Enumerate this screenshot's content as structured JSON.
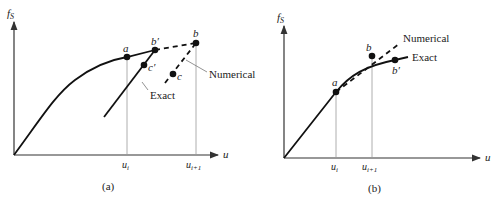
{
  "panel_a": {
    "caption": "(a)",
    "y_axis_label": "f",
    "y_axis_sub": "S",
    "x_axis_label": "u",
    "tick_ui": "u",
    "tick_ui_sub": "i",
    "tick_ui1": "u",
    "tick_ui1_sub": "i+1",
    "point_a": "a",
    "point_b": "b",
    "point_bprime": "b′",
    "point_c": "c",
    "point_cprime": "c′",
    "label_exact": "Exact",
    "label_numerical": "Numerical"
  },
  "panel_b": {
    "caption": "(b)",
    "y_axis_label": "f",
    "y_axis_sub": "S",
    "x_axis_label": "u",
    "tick_ui": "u",
    "tick_ui_sub": "i",
    "tick_ui1": "u",
    "tick_ui1_sub": "i+1",
    "point_a": "a",
    "point_b": "b",
    "point_bprime": "b′",
    "label_exact": "Exact",
    "label_numerical": "Numerical"
  }
}
